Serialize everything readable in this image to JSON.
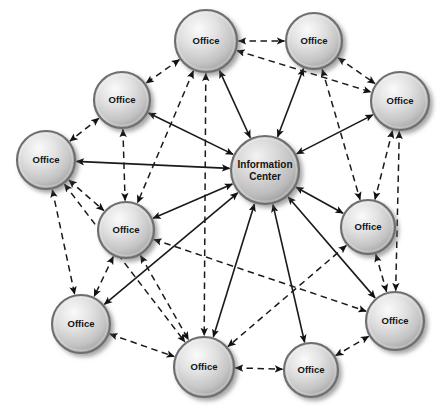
{
  "diagram": {
    "type": "network-graph",
    "title": "",
    "background_color": "#ffffff",
    "node_fill_light": "#f0f0f0",
    "node_fill_mid": "#c9c9c9",
    "node_fill_dark": "#8f8f8f",
    "node_stroke_color": "#6e6e6e",
    "edge_color": "#1a1a1a",
    "label_color": "#141414",
    "nodes": [
      {
        "id": "hub",
        "label_line1": "Information",
        "label_line2": "Center",
        "label": "Information Center",
        "kind": "hub",
        "cx": 265,
        "cy": 170,
        "r": 34
      },
      {
        "id": "o1",
        "label": "Office",
        "kind": "office",
        "cx": 206,
        "cy": 41,
        "r": 31
      },
      {
        "id": "o2",
        "label": "Office",
        "kind": "office",
        "cx": 314,
        "cy": 41,
        "r": 28
      },
      {
        "id": "o3",
        "label": "Office",
        "kind": "office",
        "cx": 122,
        "cy": 100,
        "r": 28
      },
      {
        "id": "o4",
        "label": "Office",
        "kind": "office",
        "cx": 400,
        "cy": 101,
        "r": 29
      },
      {
        "id": "o5",
        "label": "Office",
        "kind": "office",
        "cx": 46,
        "cy": 160,
        "r": 29
      },
      {
        "id": "o6",
        "label": "Office",
        "kind": "office",
        "cx": 126,
        "cy": 230,
        "r": 28
      },
      {
        "id": "o7",
        "label": "Office",
        "kind": "office",
        "cx": 368,
        "cy": 227,
        "r": 27
      },
      {
        "id": "o8",
        "label": "Office",
        "kind": "office",
        "cx": 81,
        "cy": 324,
        "r": 29
      },
      {
        "id": "o9",
        "label": "Office",
        "kind": "office",
        "cx": 395,
        "cy": 321,
        "r": 29
      },
      {
        "id": "o10",
        "label": "Office",
        "kind": "office",
        "cx": 204,
        "cy": 367,
        "r": 30
      },
      {
        "id": "o11",
        "label": "Office",
        "kind": "office",
        "cx": 311,
        "cy": 370,
        "r": 27
      }
    ],
    "edges": [
      {
        "from": "hub",
        "to": "o1",
        "style": "solid",
        "arrows": "both"
      },
      {
        "from": "hub",
        "to": "o2",
        "style": "solid",
        "arrows": "both"
      },
      {
        "from": "hub",
        "to": "o3",
        "style": "solid",
        "arrows": "both"
      },
      {
        "from": "hub",
        "to": "o4",
        "style": "solid",
        "arrows": "both"
      },
      {
        "from": "hub",
        "to": "o5",
        "style": "solid",
        "arrows": "both"
      },
      {
        "from": "hub",
        "to": "o6",
        "style": "solid",
        "arrows": "both"
      },
      {
        "from": "hub",
        "to": "o7",
        "style": "solid",
        "arrows": "both"
      },
      {
        "from": "hub",
        "to": "o8",
        "style": "solid",
        "arrows": "both"
      },
      {
        "from": "hub",
        "to": "o9",
        "style": "solid",
        "arrows": "both"
      },
      {
        "from": "hub",
        "to": "o10",
        "style": "solid",
        "arrows": "both"
      },
      {
        "from": "hub",
        "to": "o11",
        "style": "solid",
        "arrows": "both"
      },
      {
        "from": "o1",
        "to": "o2",
        "style": "dashed",
        "arrows": "both"
      },
      {
        "from": "o1",
        "to": "o3",
        "style": "dashed",
        "arrows": "both"
      },
      {
        "from": "o1",
        "to": "o4",
        "style": "dashed",
        "arrows": "both"
      },
      {
        "from": "o1",
        "to": "o6",
        "style": "dashed",
        "arrows": "both"
      },
      {
        "from": "o1",
        "to": "o10",
        "style": "dashed",
        "arrows": "both"
      },
      {
        "from": "o2",
        "to": "o4",
        "style": "dashed",
        "arrows": "both"
      },
      {
        "from": "o2",
        "to": "o7",
        "style": "dashed",
        "arrows": "both"
      },
      {
        "from": "o3",
        "to": "o5",
        "style": "dashed",
        "arrows": "both"
      },
      {
        "from": "o3",
        "to": "o6",
        "style": "dashed",
        "arrows": "both"
      },
      {
        "from": "o4",
        "to": "o7",
        "style": "dashed",
        "arrows": "both"
      },
      {
        "from": "o4",
        "to": "o9",
        "style": "dashed",
        "arrows": "both"
      },
      {
        "from": "o5",
        "to": "o6",
        "style": "dashed",
        "arrows": "both"
      },
      {
        "from": "o5",
        "to": "o8",
        "style": "dashed",
        "arrows": "both"
      },
      {
        "from": "o6",
        "to": "o8",
        "style": "dashed",
        "arrows": "both"
      },
      {
        "from": "o6",
        "to": "o9",
        "style": "dashed",
        "arrows": "both"
      },
      {
        "from": "o6",
        "to": "o10",
        "style": "dashed",
        "arrows": "both"
      },
      {
        "from": "o7",
        "to": "o9",
        "style": "dashed",
        "arrows": "both"
      },
      {
        "from": "o7",
        "to": "o10",
        "style": "dashed",
        "arrows": "both"
      },
      {
        "from": "o8",
        "to": "o10",
        "style": "dashed",
        "arrows": "both"
      },
      {
        "from": "o9",
        "to": "o11",
        "style": "dashed",
        "arrows": "both"
      },
      {
        "from": "o10",
        "to": "o11",
        "style": "dashed",
        "arrows": "both"
      },
      {
        "from": "o5",
        "to": "o10",
        "style": "dashed",
        "arrows": "both"
      }
    ]
  }
}
